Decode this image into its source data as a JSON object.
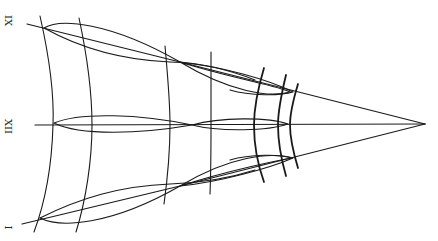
{
  "diagram": {
    "labels": [
      {
        "id": "top",
        "text": "IX",
        "x": 6,
        "y": 20
      },
      {
        "id": "middle",
        "text": "XII",
        "x": 4,
        "y": 127
      },
      {
        "id": "bottom",
        "text": "I",
        "x": 10,
        "y": 228
      }
    ],
    "apex": {
      "x": 425,
      "y": 124
    },
    "stroke_color": "#1a1a1a",
    "background": "#ffffff"
  }
}
